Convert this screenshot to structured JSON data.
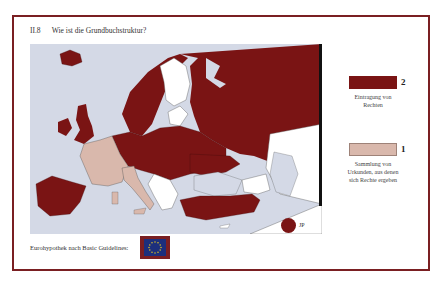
{
  "header": {
    "section_number": "II.8",
    "title": "Wie ist die Grundbuchstruktur?"
  },
  "legend": {
    "items": [
      {
        "value": "2",
        "label_line1": "Eintragung von",
        "label_line2": "Rechten",
        "color": "#7a1414"
      },
      {
        "value": "1",
        "label_line1": "Sammlung von",
        "label_line2": "Urkunden, aus denen",
        "label_line3": "sich Rechte ergeben",
        "color": "#d9b8ac"
      }
    ]
  },
  "map": {
    "sea_color": "#d4d9e6",
    "category_2_color": "#7a1414",
    "category_1_color": "#d9b8ac",
    "no_data_color": "#ffffff",
    "extra_marker": {
      "label": "JP",
      "color": "#7a1414"
    }
  },
  "footer": {
    "label": "Eurohypothek nach Basic Guidelines:",
    "flag_icon": "eu-flag-icon"
  },
  "colors": {
    "frame": "#7a1f22",
    "flag_blue": "#1c2f7c",
    "flag_stars": "#f2d21b"
  }
}
